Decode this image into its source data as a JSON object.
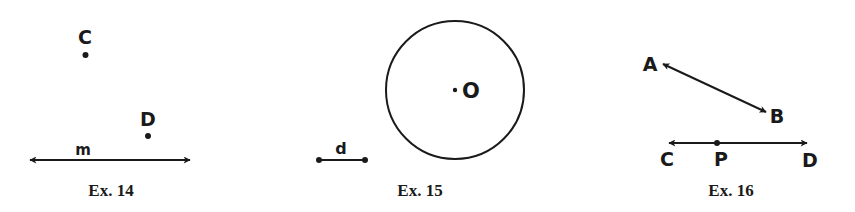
{
  "figures": [
    {
      "id": "ex14",
      "caption": "Ex. 14",
      "elements": {
        "line_label": "m",
        "point_c_label": "C",
        "point_d_label": "D"
      }
    },
    {
      "id": "ex15",
      "caption": "Ex. 15",
      "elements": {
        "segment_label": "d",
        "center_label": "O"
      }
    },
    {
      "id": "ex16",
      "caption": "Ex. 16",
      "elements": {
        "point_a_label": "A",
        "point_b_label": "B",
        "point_c_label": "C",
        "point_p_label": "P",
        "point_d_label": "D"
      }
    }
  ],
  "colors": {
    "ink": "#1a1a1a",
    "background": "#ffffff"
  }
}
